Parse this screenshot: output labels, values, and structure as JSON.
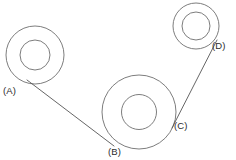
{
  "figure": {
    "background_color": "#ffffff",
    "stroke_color": "#6e6e6e",
    "belt_color": "#555555",
    "label_color": "#2b2b2b",
    "width": 236,
    "height": 160
  },
  "labels": {
    "a": "(A)",
    "b": "(B)",
    "c": "(C)",
    "d": "(D)"
  },
  "chart_data": {
    "type": "diagram",
    "pulleys": [
      {
        "id": "A",
        "label": "(A)",
        "center_x": 35,
        "center_y": 55,
        "outer_radius": 29,
        "inner_radius": 15,
        "label_x": 3,
        "label_y": 86
      },
      {
        "id": "B",
        "label": "(B)",
        "center_x": 139,
        "center_y": 112,
        "outer_radius": 37,
        "inner_radius": 17.5,
        "label_x": 108,
        "label_y": 147
      },
      {
        "id": "D",
        "label": "(D)",
        "center_x": 196,
        "center_y": 26,
        "outer_radius": 23,
        "inner_radius": 14,
        "label_x": 212,
        "label_y": 41
      }
    ],
    "contact_points": [
      {
        "id": "A",
        "x": 27,
        "y": 80
      },
      {
        "id": "B",
        "x": 114,
        "y": 146
      },
      {
        "id": "C",
        "x": 172,
        "y": 128,
        "label": "(C)",
        "label_x": 174,
        "label_y": 121
      },
      {
        "id": "D",
        "x": 217,
        "y": 40
      }
    ],
    "belt_segments": [
      {
        "from": "A",
        "to": "B",
        "x1": 27,
        "y1": 80,
        "x2": 114,
        "y2": 146
      },
      {
        "from": "C",
        "to": "D",
        "x1": 172,
        "y1": 128,
        "x2": 217,
        "y2": 40
      }
    ],
    "xlabel": "",
    "ylabel": "",
    "grid": false,
    "legend": "none"
  }
}
